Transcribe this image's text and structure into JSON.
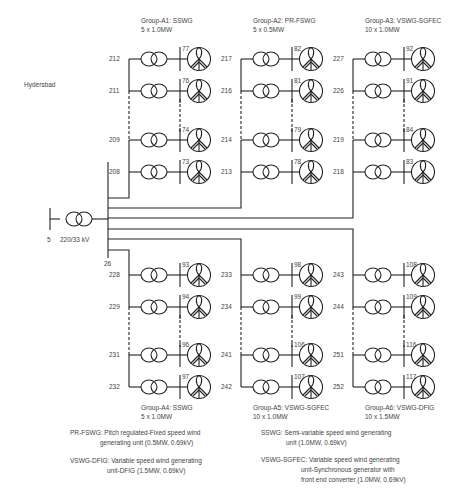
{
  "source": {
    "name": "Hydersbad",
    "bus_id": "5",
    "transformer_label": "220/33 kV",
    "collector_bus_id": "26"
  },
  "groups": [
    {
      "id": "A1",
      "title": "Group-A1: SSWG",
      "capacity": "5 x 1.0MW",
      "units": [
        {
          "feeder_bus": "212",
          "gen_bus": "77",
          "node": "217"
        },
        {
          "feeder_bus": "211",
          "gen_bus": "76",
          "node": "216"
        },
        {
          "feeder_bus": "209",
          "gen_bus": "74",
          "node": "214"
        },
        {
          "feeder_bus": "208",
          "gen_bus": "73",
          "node": "213"
        }
      ]
    },
    {
      "id": "A2",
      "title": "Group-A2: PR-FSWG",
      "capacity": "5 x 0.5MW",
      "units": [
        {
          "feeder_bus": "217",
          "gen_bus": "82"
        },
        {
          "feeder_bus": "216",
          "gen_bus": "81"
        },
        {
          "feeder_bus": "214",
          "gen_bus": "79"
        },
        {
          "feeder_bus": "213",
          "gen_bus": "78"
        }
      ]
    },
    {
      "id": "A3",
      "title": "Group-A3: VSWG-SGFEC",
      "capacity": "10 x 1.0MW",
      "units": [
        {
          "feeder_bus": "227",
          "gen_bus": "92"
        },
        {
          "feeder_bus": "226",
          "gen_bus": "91"
        },
        {
          "feeder_bus": "219",
          "gen_bus": "84"
        },
        {
          "feeder_bus": "218",
          "gen_bus": "83"
        }
      ]
    },
    {
      "id": "A4",
      "title": "Group-A4: SSWG",
      "capacity": "5 x 1.0MW",
      "units": [
        {
          "feeder_bus": "228",
          "gen_bus": "93"
        },
        {
          "feeder_bus": "229",
          "gen_bus": "94"
        },
        {
          "feeder_bus": "231",
          "gen_bus": "96"
        },
        {
          "feeder_bus": "232",
          "gen_bus": "97"
        }
      ]
    },
    {
      "id": "A5",
      "title": "Group-A5: VSWG-SGFEC",
      "capacity": "10 x 1.0MW",
      "units": [
        {
          "feeder_bus": "233",
          "gen_bus": "98"
        },
        {
          "feeder_bus": "234",
          "gen_bus": "99"
        },
        {
          "feeder_bus": "241",
          "gen_bus": "106"
        },
        {
          "feeder_bus": "242",
          "gen_bus": "107"
        }
      ]
    },
    {
      "id": "A6",
      "title": "Group-A6: VSWG-DFIG",
      "capacity": "10 x 1.5MW",
      "units": [
        {
          "feeder_bus": "243",
          "gen_bus": "108"
        },
        {
          "feeder_bus": "244",
          "gen_bus": "109"
        },
        {
          "feeder_bus": "251",
          "gen_bus": "116"
        },
        {
          "feeder_bus": "252",
          "gen_bus": "117"
        }
      ]
    }
  ],
  "legend": {
    "pr_fswg": [
      "PR-FSWG: Pitch regulated-Fixed speed wind",
      "generating unit (0.5MW, 0.69kV)"
    ],
    "vswg_dfig": [
      "VSWG-DFIG: Variable speed wind generating",
      "unit-DFIG (1.5MW, 0.69kV)"
    ],
    "sswg": [
      "SSWG: Semi-variable speed wind generating",
      "unit (1.0MW, 0.69kV)"
    ],
    "vswg_sgfec": [
      "VSWG-SGFEC: Variable speed wind generating",
      "unit-Synchronous generator with",
      "front end converter (1.0MW, 0.69kV)"
    ]
  },
  "colors": {
    "line": "#222222",
    "text": "#444444",
    "background": "#ffffff"
  }
}
